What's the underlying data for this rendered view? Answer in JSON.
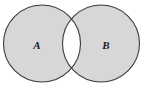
{
  "figure": {
    "width": 143,
    "height": 90,
    "background_color": "#ffffff"
  },
  "style": {
    "fill_color": "#d7d7d7",
    "intersection_fill_color": "#fdfdfd",
    "stroke_color": "#3a3a3a",
    "stroke_width": 1.1,
    "label_color": "#1c1c1c"
  },
  "sets": [
    {
      "id": "A",
      "label": "A",
      "shaded": true,
      "center_x": 42,
      "center_y": 43.5,
      "radius": 38.5,
      "label_x": 37,
      "label_y": 46
    },
    {
      "id": "B",
      "label": "B",
      "shaded": true,
      "center_x": 101,
      "center_y": 43.5,
      "radius": 38.5,
      "label_x": 106,
      "label_y": 46
    }
  ],
  "regions": [
    {
      "id": "A-only",
      "shaded": true,
      "fill": "#d7d7d7"
    },
    {
      "id": "B-only",
      "shaded": true,
      "fill": "#d7d7d7"
    },
    {
      "id": "A-intersect-B",
      "shaded": false,
      "fill": "#fdfdfd"
    }
  ],
  "intersection": {
    "shaded": false,
    "top_crossing_x": 71.5,
    "top_crossing_y": 9,
    "bottom_crossing_x": 71.5,
    "bottom_crossing_y": 78
  }
}
